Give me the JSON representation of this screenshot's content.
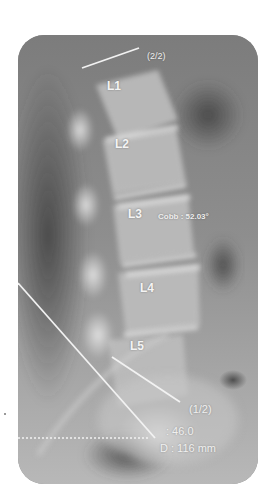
{
  "image": {
    "description": "Lateral lumbar spine X-ray with Cobb angle measurement overlay",
    "colors": {
      "background": "#ffffff",
      "overlay_lines": "#f2f2f2",
      "label_text": "#f4f4f4"
    }
  },
  "vertebrae": [
    {
      "label": "L1"
    },
    {
      "label": "L2"
    },
    {
      "label": "L3"
    },
    {
      "label": "L4"
    },
    {
      "label": "L5"
    }
  ],
  "measurements": {
    "cobb_label": "Cobb : 52.03°",
    "line_top_tag": "(2/2)",
    "line_bottom_tag": "(1/2)",
    "angle_value": ": 46.0",
    "distance_value": "D : 116 mm"
  }
}
